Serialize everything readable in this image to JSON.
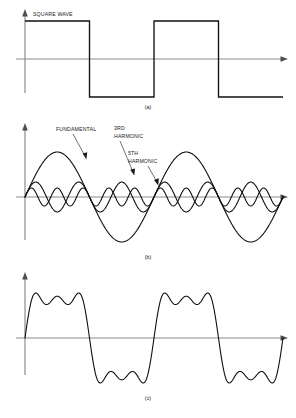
{
  "figure": {
    "background_color": "#ffffff",
    "curve_color": "#101010",
    "axis_color": "#8c8c8c",
    "text_color": "#1a1a1a",
    "width": 296,
    "height": 418
  },
  "panels": [
    {
      "id": "a",
      "caption": "(a)",
      "label": "SQUARE WAVE",
      "axis_y": 59,
      "axis_x": 25,
      "x_start": 25,
      "x_end": 283,
      "amplitude": 38
    },
    {
      "id": "b",
      "caption": "(b)",
      "axis_y": 197,
      "axis_x": 25,
      "x_start": 25,
      "x_end": 283,
      "labels": [
        {
          "name": "fundamental",
          "lines": [
            "FUNDAMENTAL"
          ],
          "text_x": 56,
          "text_y": 130
        },
        {
          "name": "third-harmonic",
          "lines": [
            "3RD",
            "HARMONIC"
          ],
          "text_x": 114,
          "text_y": 130
        },
        {
          "name": "fifth-harmonic",
          "lines": [
            "5TH",
            "HARMONIC"
          ],
          "text_x": 128,
          "text_y": 155
        }
      ]
    },
    {
      "id": "c",
      "caption": "(c)",
      "axis_y": 338,
      "axis_x": 25,
      "x_start": 25,
      "x_end": 283
    }
  ],
  "captions": {
    "a": "(a)",
    "b": "(b)",
    "c": "(c)"
  },
  "chart_data": {
    "type": "line",
    "xlabel": "",
    "ylabel": "",
    "grid": false,
    "legend": "inline-annotations",
    "cycles": 2,
    "panels": [
      {
        "id": "a",
        "caption": "(a)",
        "description": "Ideal square wave, two complete cycles",
        "series": [
          {
            "name": "SQUARE WAVE",
            "waveform": "square",
            "amplitude": 1.0,
            "harmonic": 1,
            "points": [
              [
                0.0,
                1.0
              ],
              [
                0.25,
                1.0
              ],
              [
                0.25,
                -1.0
              ],
              [
                0.5,
                -1.0
              ],
              [
                0.5,
                1.0
              ],
              [
                0.75,
                1.0
              ],
              [
                0.75,
                -1.0
              ],
              [
                1.0,
                -1.0
              ]
            ]
          }
        ]
      },
      {
        "id": "b",
        "caption": "(b)",
        "description": "Fundamental sine plus 3rd and 5th harmonic components shown separately",
        "series": [
          {
            "name": "FUNDAMENTAL",
            "waveform": "sine",
            "harmonic": 1,
            "amplitude": 1.0,
            "relative_amplitude": 1.0
          },
          {
            "name": "3RD HARMONIC",
            "waveform": "sine",
            "harmonic": 3,
            "amplitude": 0.333,
            "relative_amplitude": 0.333
          },
          {
            "name": "5TH HARMONIC",
            "waveform": "sine",
            "harmonic": 5,
            "amplitude": 0.2,
            "relative_amplitude": 0.2
          }
        ]
      },
      {
        "id": "c",
        "caption": "(c)",
        "description": "Sum of fundamental, 3rd and 5th harmonics approximating a square wave",
        "series": [
          {
            "name": "SUM",
            "waveform": "fourier-sum",
            "terms": [
              {
                "harmonic": 1,
                "amplitude": 1.0
              },
              {
                "harmonic": 3,
                "amplitude": 0.333
              },
              {
                "harmonic": 5,
                "amplitude": 0.2
              }
            ]
          }
        ]
      }
    ]
  }
}
